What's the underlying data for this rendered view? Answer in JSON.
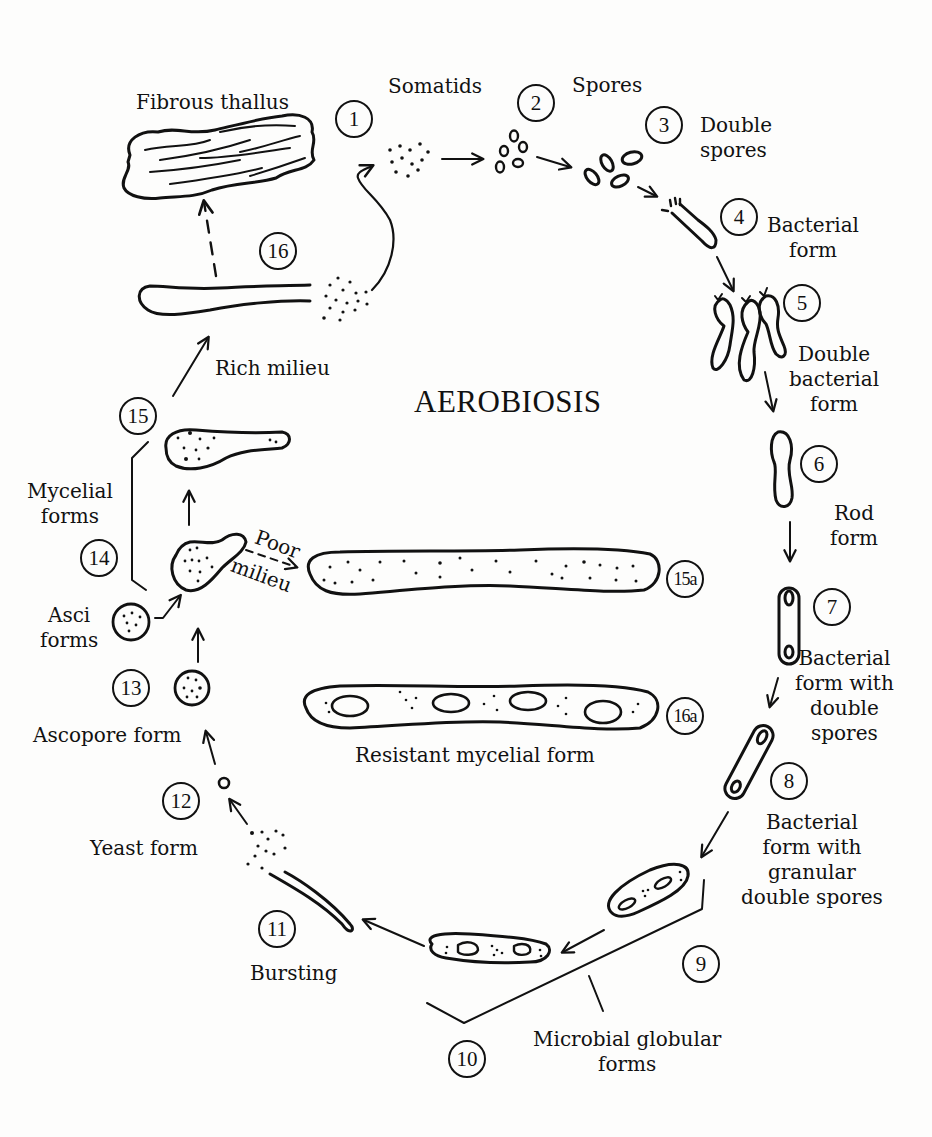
{
  "diagram": {
    "title": "AEROBIOSIS",
    "type": "life-cycle",
    "stages": [
      {
        "id": "1",
        "label": "Somatids"
      },
      {
        "id": "2",
        "label": "Spores"
      },
      {
        "id": "3",
        "label": "Double\nspores"
      },
      {
        "id": "4",
        "label": "Bacterial\nform"
      },
      {
        "id": "5",
        "label": "Double\nbacterial\nform"
      },
      {
        "id": "6",
        "label": "Rod\nform"
      },
      {
        "id": "7",
        "label": "Bacterial\nform with\ndouble\nspores"
      },
      {
        "id": "8",
        "label": "Bacterial\nform with\ngranular\ndouble spores"
      },
      {
        "id": "9",
        "label": ""
      },
      {
        "id": "10",
        "label": ""
      },
      {
        "id": "11",
        "label": "Bursting"
      },
      {
        "id": "12",
        "label": "Yeast form"
      },
      {
        "id": "13",
        "label": "Ascopore form"
      },
      {
        "id": "14",
        "label": ""
      },
      {
        "id": "15",
        "label": ""
      },
      {
        "id": "16",
        "label": ""
      },
      {
        "id": "15a",
        "label": ""
      },
      {
        "id": "16a",
        "label": ""
      }
    ],
    "group_labels": {
      "microbial_globular": "Microbial globular\nforms",
      "mycelial": "Mycelial\nforms",
      "asci": "Asci\nforms",
      "resistant": "Resistant mycelial form",
      "fibrous": "Fibrous thallus",
      "rich": "Rich milieu",
      "poor_1": "Poor",
      "poor_2": "milieu"
    },
    "transitions": [
      {
        "from": "1",
        "to": "2"
      },
      {
        "from": "2",
        "to": "3"
      },
      {
        "from": "3",
        "to": "4"
      },
      {
        "from": "4",
        "to": "5"
      },
      {
        "from": "5",
        "to": "6"
      },
      {
        "from": "6",
        "to": "7"
      },
      {
        "from": "7",
        "to": "8"
      },
      {
        "from": "8",
        "to": "9"
      },
      {
        "from": "9",
        "to": "10"
      },
      {
        "from": "10",
        "to": "11"
      },
      {
        "from": "11",
        "to": "12"
      },
      {
        "from": "12",
        "to": "13"
      },
      {
        "from": "13",
        "to": "14"
      },
      {
        "from": "asci",
        "to": "14"
      },
      {
        "from": "14",
        "to": "15"
      },
      {
        "from": "15",
        "to": "16",
        "label": "Rich milieu"
      },
      {
        "from": "16",
        "to": "1"
      },
      {
        "from": "16",
        "to": "fibrous",
        "style": "dashed"
      },
      {
        "from": "14",
        "to": "15a",
        "style": "dashed",
        "label": "Poor milieu"
      }
    ],
    "colors": {
      "ink": "#111111",
      "paper": "#fdfdfc"
    }
  }
}
